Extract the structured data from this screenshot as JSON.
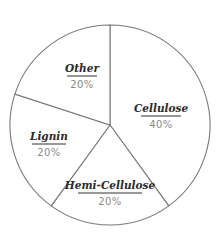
{
  "chart_data": {
    "type": "pie",
    "title": "",
    "categories": [
      "Cellulose",
      "Hemi-Cellulose",
      "Lignin",
      "Other"
    ],
    "values": [
      40,
      20,
      20,
      20
    ],
    "labels": [
      {
        "name": "Cellulose",
        "value": "40%"
      },
      {
        "name": "Hemi-Cellulose",
        "value": "20%"
      },
      {
        "name": "Lignin",
        "value": "20%"
      },
      {
        "name": "Other",
        "value": "20%"
      }
    ],
    "start_angle": "12 o'clock, clockwise",
    "legend": "none (inline labels)",
    "colors": {
      "fill": "#ffffff",
      "stroke": "#7a7a7a",
      "label": "#2a2a2a",
      "value": "#8a8a8a"
    }
  }
}
